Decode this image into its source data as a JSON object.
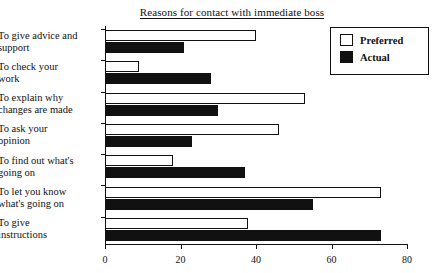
{
  "chart_data": {
    "type": "bar",
    "orientation": "horizontal",
    "title": "Reasons for contact with immediate boss",
    "xlabel": "",
    "ylabel": "",
    "xlim": [
      0,
      80
    ],
    "xticks": [
      0,
      20,
      40,
      60,
      80
    ],
    "grid": false,
    "legend_position": "top-right",
    "categories": [
      "To give advice and\nsupport",
      "To check your\nwork",
      "To explain why\nchanges are made",
      "To ask your\nopinion",
      "To find out what's\ngoing on",
      "To let you know\nwhat's going on",
      "To give\ninstructions"
    ],
    "series": [
      {
        "name": "Preferred",
        "color": "#ffffff",
        "values": [
          40,
          9,
          53,
          46,
          18,
          73,
          38
        ]
      },
      {
        "name": "Actual",
        "color": "#111111",
        "values": [
          21,
          28,
          30,
          23,
          37,
          55,
          73
        ]
      }
    ]
  }
}
